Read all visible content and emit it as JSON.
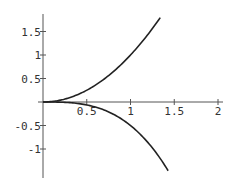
{
  "chart_data": {
    "type": "line",
    "title": "",
    "xlabel": "",
    "ylabel": "",
    "xlim": [
      0,
      2.05
    ],
    "ylim": [
      -1.55,
      1.85
    ],
    "grid": false,
    "legend": null,
    "x_ticks": [
      "0.5",
      "1",
      "1.5",
      "2"
    ],
    "y_ticks": [
      "1.5",
      "1",
      "0.5",
      "-0.5",
      "-1"
    ],
    "series": [
      {
        "name": "upper",
        "expression": "y = x^2",
        "x": [
          0,
          0.25,
          0.5,
          0.75,
          1.0,
          1.2,
          1.34
        ],
        "y": [
          0,
          0.06,
          0.25,
          0.56,
          1.0,
          1.44,
          1.8
        ]
      },
      {
        "name": "lower",
        "expression": "y = -x^3/2",
        "x": [
          0,
          0.25,
          0.5,
          0.75,
          1.0,
          1.2,
          1.43
        ],
        "y": [
          0,
          -0.01,
          -0.06,
          -0.21,
          -0.5,
          -0.86,
          -1.46
        ]
      }
    ],
    "colors": {
      "curve": "#222222",
      "axis": "#555555"
    }
  }
}
